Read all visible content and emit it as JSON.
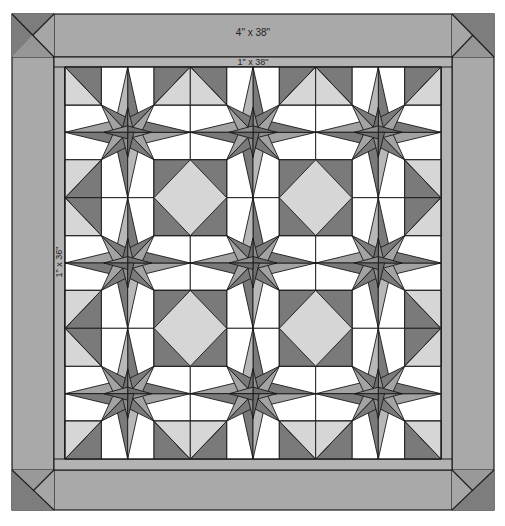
{
  "diagram": {
    "type": "quilt-layout",
    "labels": {
      "outer_border": "4\" x 38\"",
      "inner_border_top": "1\" x 38\"",
      "inner_border_side": "1\" x 36\""
    },
    "layout": {
      "blocks_rows": 3,
      "blocks_cols": 3,
      "block_pattern": "eight-point star",
      "corner_blocks": 4
    },
    "colors": {
      "dark": "#7a7a7a",
      "medium": "#a3a3a3",
      "light": "#d6d6d6",
      "white": "#ffffff",
      "border": "#a8a8a8",
      "strip": "#b0b0b0",
      "outline": "#1a1a1a"
    }
  }
}
